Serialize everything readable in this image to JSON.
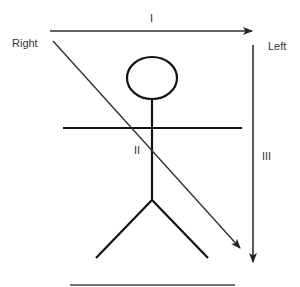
{
  "diagram": {
    "type": "stick-figure-orientation",
    "labels": {
      "right": "Right",
      "left": "Left",
      "arrow_1": "I",
      "arrow_2": "II",
      "arrow_3": "III"
    },
    "arrows": [
      {
        "id": "I",
        "direction": "horizontal",
        "from": "Right",
        "to": "Left"
      },
      {
        "id": "II",
        "direction": "diagonal",
        "from": "top-left",
        "to": "bottom-right"
      },
      {
        "id": "III",
        "direction": "vertical",
        "from": "top",
        "to": "bottom"
      }
    ],
    "figure": {
      "parts": [
        "head",
        "body",
        "arms",
        "left-leg",
        "right-leg"
      ]
    },
    "ground_line": true,
    "colors": {
      "stroke": "#111111",
      "arrow": "#222222",
      "text": "#333333",
      "background": "#ffffff"
    }
  }
}
